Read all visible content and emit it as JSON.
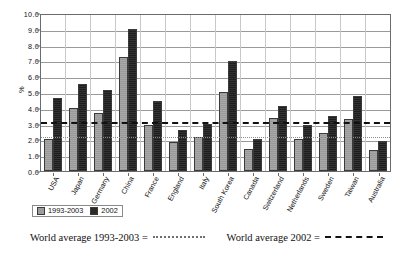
{
  "chart_data": {
    "type": "bar",
    "title": "",
    "xlabel": "",
    "ylabel": "%",
    "ylim": [
      0.0,
      10.0
    ],
    "ytick_step": 1.0,
    "ytick_labels": [
      "10.0",
      "9.0",
      "8.0",
      "7.0",
      "6.0",
      "5.0",
      "4.0",
      "3.0",
      "2.0",
      "1.0",
      "0.0"
    ],
    "grid": true,
    "legend_position": "bottom-left",
    "categories": [
      "USA",
      "Japan",
      "Germany",
      "China",
      "France",
      "England",
      "Italy",
      "South Korea",
      "Canada",
      "Switzerland",
      "Netherlands",
      "Sweden",
      "Taiwan",
      "Australia"
    ],
    "series": [
      {
        "name": "1993-2003",
        "color": "#9c9c9c",
        "values": [
          2.0,
          4.0,
          3.65,
          7.2,
          2.9,
          1.85,
          2.15,
          5.0,
          1.4,
          3.35,
          2.0,
          2.4,
          3.3,
          1.35
        ]
      },
      {
        "name": "2002",
        "color": "#2a2a2a",
        "values": [
          4.6,
          5.5,
          5.1,
          9.0,
          4.4,
          2.6,
          3.0,
          6.95,
          2.0,
          4.1,
          2.9,
          3.5,
          4.75,
          1.9
        ]
      }
    ],
    "reference_lines": [
      {
        "name": "World average 1993-2003",
        "value": 2.25,
        "style": "dotted",
        "color": "#8d8d8d"
      },
      {
        "name": "World average 2002",
        "value": 3.25,
        "style": "dashed",
        "color": "#111111"
      }
    ],
    "annotations": [
      {
        "label": "World average 1993-2003 =",
        "style": "dotted"
      },
      {
        "label": "World average 2002 =",
        "style": "dashed"
      }
    ]
  },
  "legend": {
    "items": [
      {
        "label": "1993-2003"
      },
      {
        "label": "2002"
      }
    ]
  },
  "notes": {
    "left_label": "World average 1993-2003 =",
    "right_label": "World average 2002 ="
  }
}
